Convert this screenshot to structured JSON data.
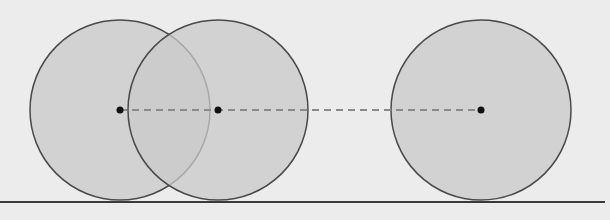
{
  "diagram": {
    "background": "#ececec",
    "circle_fill": "#c9c9c9",
    "circle_stroke": "#4a4a4a",
    "dash_color": "#8a8a8a",
    "dot_color": "#111111",
    "ground_color": "#3a3a3a",
    "ground": {
      "x1": 0,
      "x2": 605,
      "y": 202
    },
    "circles": [
      {
        "cx": 120,
        "cy": 110,
        "r": 90
      },
      {
        "cx": 218,
        "cy": 110,
        "r": 90
      },
      {
        "cx": 481,
        "cy": 110,
        "r": 90
      }
    ],
    "center_line": {
      "x1": 120,
      "x2": 481,
      "y": 110
    }
  }
}
